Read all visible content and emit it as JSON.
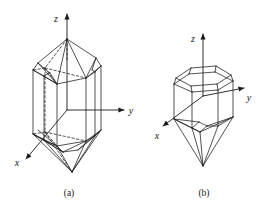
{
  "figure": {
    "kind": "line-diagram",
    "background_color": "#ffffff",
    "line_color": "#1a1a1a",
    "text_color": "#1a1a1a",
    "panels": [
      {
        "id": "a",
        "label": "(a)",
        "description": "elongated doubly terminated hexagonal prism crystal",
        "axes": [
          {
            "name": "z",
            "label": "z",
            "direction": "up"
          },
          {
            "name": "y",
            "label": "y",
            "direction": "right"
          },
          {
            "name": "x",
            "label": "x",
            "direction": "down-left"
          }
        ]
      },
      {
        "id": "b",
        "label": "(b)",
        "description": "short beveled hexagonal crystal with pyramidal termination",
        "axes": [
          {
            "name": "z",
            "label": "z",
            "direction": "up"
          },
          {
            "name": "y",
            "label": "y",
            "direction": "right"
          },
          {
            "name": "x",
            "label": "x",
            "direction": "down-left"
          }
        ]
      }
    ]
  },
  "labels": {
    "panel_a": "(a)",
    "panel_b": "(b)",
    "a_axis_z": "z",
    "a_axis_y": "y",
    "a_axis_x": "x",
    "b_axis_z": "z",
    "b_axis_y": "y",
    "b_axis_x": "x"
  }
}
